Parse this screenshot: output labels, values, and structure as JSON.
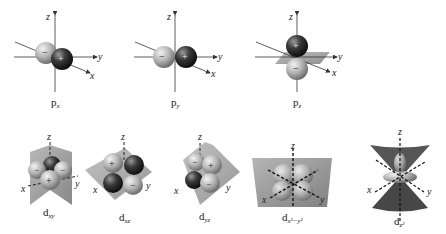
{
  "diagram": {
    "p_orbitals": [
      {
        "label": "p",
        "subscript": "x",
        "lobes": [
          "−",
          "+"
        ]
      },
      {
        "label": "p",
        "subscript": "y",
        "lobes": [
          "−",
          "+"
        ]
      },
      {
        "label": "p",
        "subscript": "z",
        "lobes": [
          "+",
          "−"
        ]
      }
    ],
    "d_orbitals": [
      {
        "label": "d",
        "subscript": "xy"
      },
      {
        "label": "d",
        "subscript": "xz"
      },
      {
        "label": "d",
        "subscript": "yz"
      },
      {
        "label": "d",
        "subscript": "x²−y²"
      },
      {
        "label": "d",
        "subscript": "z²"
      }
    ],
    "axes": {
      "x": "x",
      "y": "y",
      "z": "z"
    },
    "signs": {
      "plus": "+",
      "minus": "−"
    },
    "colors": {
      "positive_lobe": "#2a2a2a",
      "negative_lobe": "#b8b8b8",
      "plane": "#8a8a8a",
      "axis": "#333333"
    }
  }
}
